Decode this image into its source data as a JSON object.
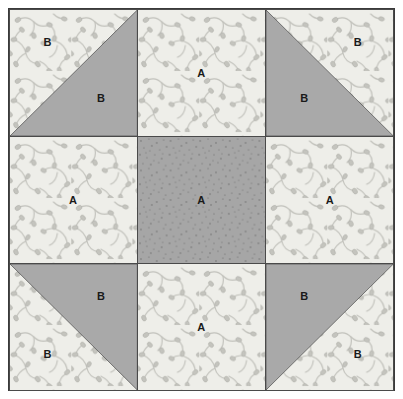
{
  "diagram": {
    "type": "quilt-block",
    "grid": {
      "rows": 3,
      "cols": 3
    },
    "colors": {
      "fabric_light": "#eeeee9",
      "fabric_gray": "#a9a9a9",
      "fabric_speckle": "#a6a6a6",
      "floral_motif": "#b9b9b4",
      "outline": "#4a4a4a",
      "border": "#3a3a3a",
      "label_text": "#1a1a1a",
      "background": "#ffffff"
    },
    "legend": {
      "a_label": "A",
      "b_label": "B"
    },
    "cells": [
      {
        "id": "top-left",
        "name": "half-square-triangle-unit",
        "row": 1,
        "col": 1,
        "pattern": "half-square-triangle",
        "diagonal": "tl-br",
        "upper_fabric": "floral-light",
        "lower_fabric": "solid-gray",
        "labels": [
          {
            "text": "B",
            "x": 30,
            "y": 26
          },
          {
            "text": "B",
            "x": 72,
            "y": 70
          }
        ]
      },
      {
        "id": "top-center",
        "name": "plain-square-unit",
        "row": 1,
        "col": 2,
        "pattern": "plain",
        "fabric": "floral-light",
        "labels": [
          {
            "text": "A",
            "x": 50,
            "y": 50
          }
        ]
      },
      {
        "id": "top-right",
        "name": "half-square-triangle-unit",
        "row": 1,
        "col": 3,
        "pattern": "half-square-triangle",
        "diagonal": "tr-bl",
        "upper_fabric": "floral-light",
        "lower_fabric": "solid-gray",
        "labels": [
          {
            "text": "B",
            "x": 72,
            "y": 26
          },
          {
            "text": "B",
            "x": 30,
            "y": 70
          }
        ]
      },
      {
        "id": "middle-left",
        "name": "plain-square-unit",
        "row": 2,
        "col": 1,
        "pattern": "plain",
        "fabric": "floral-light",
        "labels": [
          {
            "text": "A",
            "x": 50,
            "y": 50
          }
        ]
      },
      {
        "id": "middle-center",
        "name": "center-square-unit",
        "row": 2,
        "col": 2,
        "pattern": "plain",
        "fabric": "speckled-gray",
        "labels": [
          {
            "text": "A",
            "x": 50,
            "y": 50
          }
        ]
      },
      {
        "id": "middle-right",
        "name": "plain-square-unit",
        "row": 2,
        "col": 3,
        "pattern": "plain",
        "fabric": "floral-light",
        "labels": [
          {
            "text": "A",
            "x": 50,
            "y": 50
          }
        ]
      },
      {
        "id": "bottom-left",
        "name": "half-square-triangle-unit",
        "row": 3,
        "col": 1,
        "pattern": "half-square-triangle",
        "diagonal": "tr-bl",
        "upper_fabric": "solid-gray",
        "lower_fabric": "floral-light",
        "labels": [
          {
            "text": "B",
            "x": 72,
            "y": 26
          },
          {
            "text": "B",
            "x": 30,
            "y": 72
          }
        ]
      },
      {
        "id": "bottom-center",
        "name": "plain-square-unit",
        "row": 3,
        "col": 2,
        "pattern": "plain",
        "fabric": "floral-light",
        "labels": [
          {
            "text": "A",
            "x": 50,
            "y": 50
          }
        ]
      },
      {
        "id": "bottom-right",
        "name": "half-square-triangle-unit",
        "row": 3,
        "col": 3,
        "pattern": "half-square-triangle",
        "diagonal": "tl-br",
        "upper_fabric": "solid-gray",
        "lower_fabric": "floral-light",
        "labels": [
          {
            "text": "B",
            "x": 30,
            "y": 26
          },
          {
            "text": "B",
            "x": 72,
            "y": 72
          }
        ]
      }
    ]
  }
}
